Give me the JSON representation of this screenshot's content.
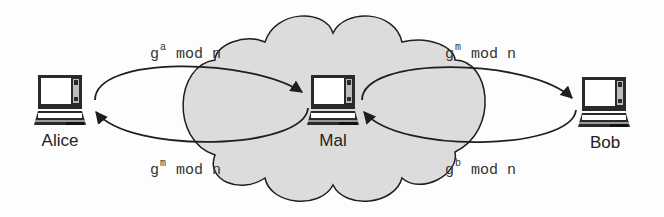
{
  "diagram": {
    "colors": {
      "background": "#fdfdfd",
      "cloud_fill": "#dcdcdc",
      "stroke": "#1e1e1e",
      "laptop_screen": "#ffffff",
      "laptop_body": "#2a2a2a"
    },
    "nodes": [
      {
        "id": "alice",
        "label": "Alice",
        "icon": "laptop-icon"
      },
      {
        "id": "mal",
        "label": "Mal",
        "icon": "laptop-icon"
      },
      {
        "id": "bob",
        "label": "Bob",
        "icon": "laptop-icon"
      }
    ],
    "network": {
      "shape": "cloud",
      "contains": "mal"
    },
    "edges": [
      {
        "from": "alice",
        "to": "mal",
        "base": "g",
        "exp": "a",
        "rest": " mod n",
        "position": "top-left"
      },
      {
        "from": "mal",
        "to": "alice",
        "base": "g",
        "exp": "m",
        "rest": " mod n",
        "position": "bottom-left"
      },
      {
        "from": "mal",
        "to": "bob",
        "base": "g",
        "exp": "m",
        "rest": " mod n",
        "position": "top-right"
      },
      {
        "from": "bob",
        "to": "mal",
        "base": "g",
        "exp": "b",
        "rest": " mod n",
        "position": "bottom-right"
      }
    ]
  }
}
